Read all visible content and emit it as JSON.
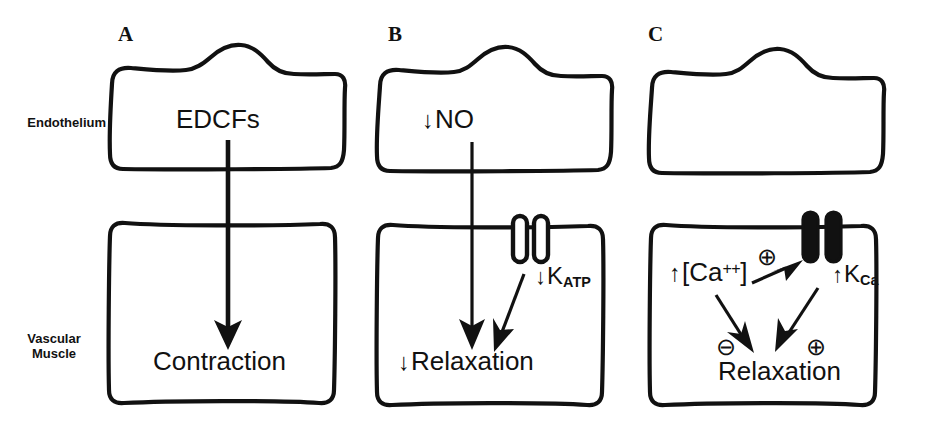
{
  "figure": {
    "width": 929,
    "height": 434,
    "background": "#ffffff",
    "ink_color": "#111111"
  },
  "side_labels": {
    "endothelium": "Endothelium",
    "vascular_muscle_line1": "Vascular",
    "vascular_muscle_line2": "Muscle"
  },
  "panels": [
    {
      "id": "A",
      "letter": "A",
      "endothelium_text": "EDCFs",
      "endothelium_arrow_prefix": "",
      "muscle_text": "Contraction",
      "muscle_arrow_prefix": "",
      "channel_state": "none",
      "channel_label": "",
      "channel_label_sub": ""
    },
    {
      "id": "B",
      "letter": "B",
      "endothelium_text": "NO",
      "endothelium_arrow_prefix": "↓",
      "muscle_text": "Relaxation",
      "muscle_arrow_prefix": "↓",
      "channel_state": "open",
      "channel_label_prefix": "↓",
      "channel_label": "K",
      "channel_label_sub": "ATP"
    },
    {
      "id": "C",
      "letter": "C",
      "endothelium_text": "",
      "endothelium_arrow_prefix": "",
      "muscle_text": "Relaxation",
      "muscle_arrow_prefix": "",
      "channel_state": "closed",
      "channel_label_prefix": "↑",
      "channel_label": "K",
      "channel_label_sub": "Ca",
      "calcium_prefix": "↑",
      "calcium_text": "[Ca",
      "calcium_sup": "++",
      "calcium_suffix": "]",
      "sign_positive_1": "⊕",
      "sign_positive_2": "⊕",
      "sign_negative": "⊖"
    }
  ],
  "diagram_data": {
    "type": "diagram",
    "description_rows": [
      "Endothelium",
      "Vascular Muscle"
    ],
    "columns": [
      "A",
      "B",
      "C"
    ]
  }
}
